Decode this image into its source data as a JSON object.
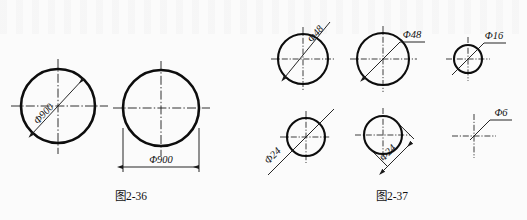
{
  "page": {
    "width": 527,
    "height": 220,
    "background_color": "#fbfbfb",
    "ink_color": "#0d0d0d",
    "type": "engineering-drawing-scan"
  },
  "figures": [
    {
      "id": "fig-2-36",
      "caption": "图2-36",
      "items": [
        {
          "id": "fig236-circle-left",
          "shape": "circle",
          "dimension_label": "Φ900",
          "dimension_style": "diagonal-inside-circle",
          "label_orientation": "rotated-along-leader"
        },
        {
          "id": "fig236-circle-right",
          "shape": "circle",
          "dimension_label": "Φ900",
          "dimension_style": "horizontal-below-with-extension-lines",
          "label_orientation": "horizontal"
        }
      ]
    },
    {
      "id": "fig-2-37",
      "caption": "图2-37",
      "items": [
        {
          "id": "fig237-circle-1",
          "shape": "circle",
          "dimension_label": "Φ48",
          "dimension_style": "diagonal-inside-circle",
          "label_orientation": "rotated-along-leader"
        },
        {
          "id": "fig237-circle-2",
          "shape": "circle",
          "dimension_label": "Φ48",
          "dimension_style": "leader-to-horizontal-shelf",
          "label_orientation": "horizontal"
        },
        {
          "id": "fig237-circle-3",
          "shape": "circle",
          "dimension_label": "Φ16",
          "dimension_style": "leader-through-circle-to-shelf",
          "label_orientation": "horizontal"
        },
        {
          "id": "fig237-circle-4",
          "shape": "circle",
          "dimension_label": "Φ24",
          "dimension_style": "diagonal-extended-outside",
          "label_orientation": "rotated-along-leader"
        },
        {
          "id": "fig237-circle-5",
          "shape": "circle",
          "dimension_label": "Φ24",
          "dimension_style": "offset-diagonal-dimension-line",
          "label_orientation": "rotated-along-leader"
        },
        {
          "id": "fig237-crosshair-6",
          "shape": "centerlines-only",
          "dimension_label": "Φ6",
          "dimension_style": "leader-to-horizontal-shelf",
          "label_orientation": "horizontal"
        }
      ]
    }
  ]
}
